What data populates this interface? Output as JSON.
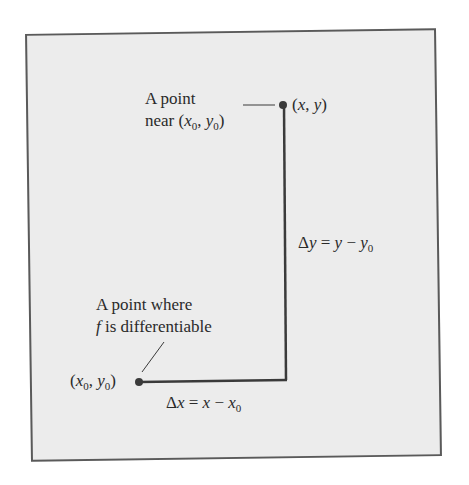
{
  "diagram": {
    "type": "increment-illustration",
    "background_color": "#ececec",
    "border_color": "#5a5a5a",
    "line_color": "#3a3a3a",
    "points": {
      "near": {
        "label_line1": "A point",
        "label_line2_prefix": "near (",
        "label_line2_x": "x",
        "label_line2_x_sub": "0",
        "label_line2_sep": ", ",
        "label_line2_y": "y",
        "label_line2_y_sub": "0",
        "label_line2_suffix": ")",
        "coord_open": "(",
        "coord_x": "x",
        "coord_sep": ", ",
        "coord_y": "y",
        "coord_close": ")"
      },
      "base": {
        "label_line1": "A point where",
        "label_line2_f": "f",
        "label_line2_rest": " is differentiable",
        "coord_open": "(",
        "coord_x": "x",
        "coord_x_sub": "0",
        "coord_sep": ", ",
        "coord_y": "y",
        "coord_y_sub": "0",
        "coord_close": ")"
      }
    },
    "increments": {
      "dx": {
        "delta": "Δ",
        "var": "x",
        "eq": " = ",
        "rhs_var": "x",
        "minus": " − ",
        "rhs_base": "x",
        "rhs_sub": "0"
      },
      "dy": {
        "delta": "Δ",
        "var": "y",
        "eq": " = ",
        "rhs_var": "y",
        "minus": " − ",
        "rhs_base": "y",
        "rhs_sub": "0"
      }
    }
  }
}
